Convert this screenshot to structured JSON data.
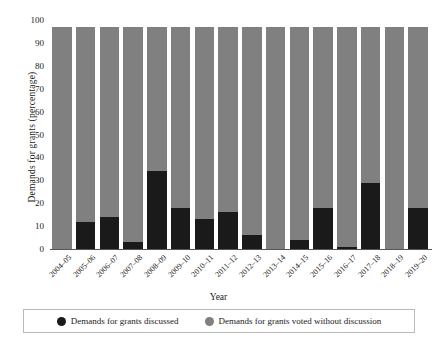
{
  "chart_data": {
    "type": "bar",
    "title": "",
    "subtitle": "",
    "xlabel": "Year",
    "ylabel": "Demands for grants (percentage)",
    "ylim": [
      0,
      100
    ],
    "yticks": [
      0,
      10,
      20,
      30,
      40,
      50,
      60,
      70,
      80,
      90,
      100
    ],
    "grid": false,
    "stacked": true,
    "bar_total": 97,
    "legend_position": "bottom",
    "categories": [
      "2004–05",
      "2005–06",
      "2006–07",
      "2007–08",
      "2008–09",
      "2009–10",
      "2010–11",
      "2011–12",
      "2012–13",
      "2013–14",
      "2014–15",
      "2015–16",
      "2016–17",
      "2017–18",
      "2018–19",
      "2019–20"
    ],
    "series": [
      {
        "name": "Demands for grants discussed",
        "color": "#1a1a1a",
        "values": [
          0,
          12,
          14,
          3,
          34,
          18,
          13,
          16,
          6,
          0,
          4,
          18,
          1,
          29,
          0,
          18
        ]
      },
      {
        "name": "Demands for grants voted without discussion",
        "color": "#808080",
        "values": [
          97,
          85,
          83,
          94,
          63,
          79,
          84,
          81,
          91,
          97,
          93,
          79,
          96,
          68,
          97,
          79
        ]
      }
    ]
  },
  "legend": {
    "items": [
      {
        "label": "Demands for grants discussed",
        "color": "#1a1a1a",
        "swatch": "filled-circle-icon"
      },
      {
        "label": "Demands for grants voted without discussion",
        "color": "#808080",
        "swatch": "filled-circle-icon"
      }
    ]
  }
}
